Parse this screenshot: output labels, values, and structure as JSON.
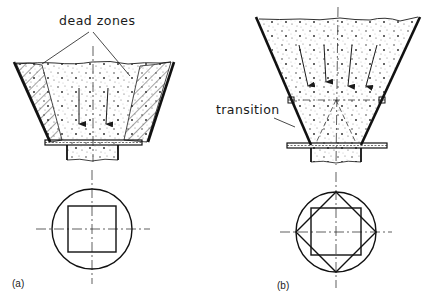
{
  "figure": {
    "panels": [
      {
        "id": "a",
        "caption": "(a)",
        "annotation": "dead zones",
        "description": "Conical hopper with square outlet showing stagnant dead zones along walls",
        "outlet_shape": "square-in-circle"
      },
      {
        "id": "b",
        "caption": "(b)",
        "annotation": "transition",
        "description": "Hopper with transition section giving mass flow to square outlet",
        "outlet_shape": "square-and-diamond-in-circle"
      }
    ]
  },
  "colors": {
    "line": "#1a1a1a",
    "background": "#ffffff",
    "hatch": "#333333",
    "speckle": "#555555"
  }
}
